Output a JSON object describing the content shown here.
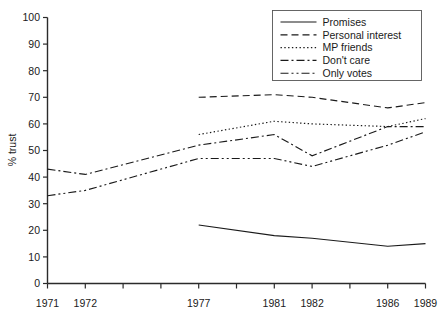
{
  "chart_data": {
    "type": "line",
    "title": "",
    "xlabel": "",
    "ylabel": "% trust",
    "ylim": [
      0,
      100
    ],
    "ytick_step": 10,
    "yticks": [
      0,
      10,
      20,
      30,
      40,
      50,
      60,
      70,
      80,
      90,
      100
    ],
    "grid": false,
    "legend_position": "top-right",
    "categories": [
      "1971",
      "1972",
      "1977",
      "1981",
      "1982",
      "1986",
      "1989"
    ],
    "x_tick_labels": [
      "1971",
      "1972",
      "1977",
      "1981",
      "1982",
      "1986",
      "1989"
    ],
    "x_tick_count": 11,
    "series": [
      {
        "name": "Promises",
        "style": "solid",
        "x": [
          "1977",
          "1981",
          "1982",
          "1986",
          "1989"
        ],
        "values": [
          22,
          18,
          17,
          14,
          15
        ]
      },
      {
        "name": "Personal interest",
        "style": "dashed",
        "x": [
          "1977",
          "1981",
          "1982",
          "1986",
          "1989"
        ],
        "values": [
          70,
          71,
          70,
          66,
          68
        ]
      },
      {
        "name": "MP friends",
        "style": "dotted",
        "x": [
          "1977",
          "1981",
          "1982",
          "1986",
          "1989"
        ],
        "values": [
          56,
          61,
          60,
          59,
          62
        ]
      },
      {
        "name": "Don't care",
        "style": "dashdot",
        "x": [
          "1971",
          "1972",
          "1977",
          "1981",
          "1982",
          "1986",
          "1989"
        ],
        "values": [
          43,
          41,
          52,
          56,
          48,
          59,
          59
        ]
      },
      {
        "name": "Only votes",
        "style": "dashdotdot",
        "x": [
          "1971",
          "1972",
          "1977",
          "1981",
          "1982",
          "1986",
          "1989"
        ],
        "values": [
          33,
          35,
          47,
          47,
          44,
          52,
          57
        ]
      }
    ]
  },
  "legend": {
    "items": [
      {
        "label": "Promises"
      },
      {
        "label": "Personal interest"
      },
      {
        "label": "MP friends"
      },
      {
        "label": "Don't care"
      },
      {
        "label": "Only votes"
      }
    ]
  },
  "axes": {
    "y_title": "% trust",
    "y_labels": [
      "100",
      "90",
      "80",
      "70",
      "60",
      "50",
      "40",
      "30",
      "20",
      "10",
      "0"
    ],
    "x_labels": [
      "1971",
      "1972",
      "1977",
      "1981",
      "1982",
      "1986",
      "1989"
    ]
  },
  "colors": {
    "ink": "#1a1a1a",
    "axis": "#2b2b2b",
    "background": "#ffffff",
    "legend_border": "#555555"
  }
}
